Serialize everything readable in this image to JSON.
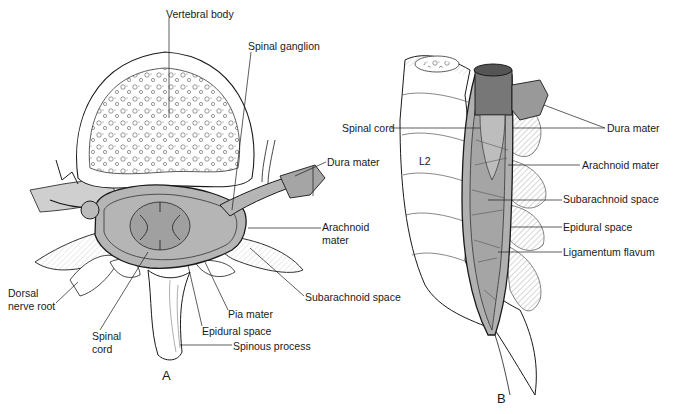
{
  "figure": {
    "panels": [
      {
        "id": "A",
        "letter": "A",
        "view": "transverse section of vertebra",
        "labels": [
          {
            "key": "vertebral_body",
            "text": "Vertebral body",
            "x": 166,
            "y": 8
          },
          {
            "key": "spinal_ganglion",
            "text": "Spinal ganglion",
            "x": 248,
            "y": 40
          },
          {
            "key": "dura_mater",
            "text": "Dura mater",
            "x": 327,
            "y": 156
          },
          {
            "key": "arachnoid_mater_line1",
            "text": "Arachnoid",
            "x": 322,
            "y": 221
          },
          {
            "key": "arachnoid_mater_line2",
            "text": "mater",
            "x": 322,
            "y": 234
          },
          {
            "key": "subarachnoid_space",
            "text": "Subarachnoid space",
            "x": 305,
            "y": 291
          },
          {
            "key": "pia_mater",
            "text": "Pia mater",
            "x": 228,
            "y": 308
          },
          {
            "key": "epidural_space",
            "text": "Epidural space",
            "x": 202,
            "y": 325
          },
          {
            "key": "spinous_process",
            "text": "Spinous process",
            "x": 233,
            "y": 340
          },
          {
            "key": "dorsal_nerve_root_line1",
            "text": "Dorsal",
            "x": 8,
            "y": 287
          },
          {
            "key": "dorsal_nerve_root_line2",
            "text": "nerve root",
            "x": 8,
            "y": 300
          },
          {
            "key": "spinal_cord_line1",
            "text": "Spinal",
            "x": 92,
            "y": 330
          },
          {
            "key": "spinal_cord_line2",
            "text": "cord",
            "x": 92,
            "y": 343
          }
        ]
      },
      {
        "id": "B",
        "letter": "B",
        "view": "sagittal section of lumbar spine",
        "labels": [
          {
            "key": "spinal_cord",
            "text": "Spinal cord",
            "x": 342,
            "y": 122
          },
          {
            "key": "l2",
            "text": "L2",
            "x": 419,
            "y": 155
          },
          {
            "key": "dura_mater",
            "text": "Dura mater",
            "x": 607,
            "y": 122
          },
          {
            "key": "arachnoid_mater",
            "text": "Arachnoid mater",
            "x": 582,
            "y": 159
          },
          {
            "key": "subarachnoid_space",
            "text": "Subarachnoid space",
            "x": 563,
            "y": 193
          },
          {
            "key": "epidural_space",
            "text": "Epidural space",
            "x": 563,
            "y": 221
          },
          {
            "key": "ligamentum_flavum",
            "text": "Ligamentum flavum",
            "x": 563,
            "y": 246
          }
        ]
      }
    ],
    "colors": {
      "line": "#1a1a1a",
      "bone_fill": "#ffffff",
      "tissue_gray": "#a8a8a8",
      "dark_gray": "#6e6e6e",
      "hatch": "#7a7a7a"
    }
  }
}
